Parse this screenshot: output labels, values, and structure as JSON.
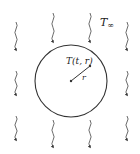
{
  "diagram": {
    "ambient_label": "T",
    "ambient_sub": "∞",
    "temperature_label": "T(t, r)",
    "radius_label": "r",
    "colors": {
      "stroke": "#333333",
      "background": "#ffffff"
    },
    "arrows": [
      {
        "x": 16,
        "y1": 22,
        "y2": 50
      },
      {
        "x": 16,
        "y1": 71,
        "y2": 95
      },
      {
        "x": 16,
        "y1": 116,
        "y2": 140
      },
      {
        "x": 53,
        "y1": 13,
        "y2": 42
      },
      {
        "x": 53,
        "y1": 120,
        "y2": 147
      },
      {
        "x": 90,
        "y1": 13,
        "y2": 42
      },
      {
        "x": 90,
        "y1": 120,
        "y2": 147
      },
      {
        "x": 127,
        "y1": 22,
        "y2": 50
      },
      {
        "x": 127,
        "y1": 71,
        "y2": 95
      },
      {
        "x": 127,
        "y1": 116,
        "y2": 140
      }
    ]
  }
}
